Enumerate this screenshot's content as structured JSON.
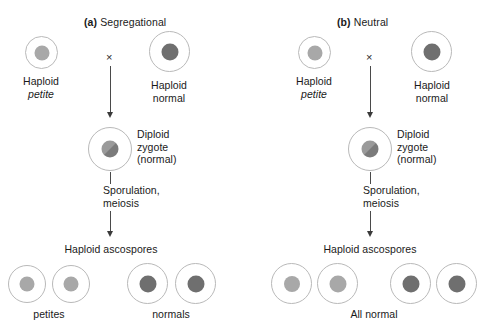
{
  "figure": {
    "caption_absent": true,
    "panels": [
      {
        "id": "a",
        "tag": "(a)",
        "title": "Segregational",
        "parents": [
          {
            "name": "haploid-petite",
            "label_line1": "Haploid",
            "label_line2": "petite",
            "label_line2_italic": true,
            "nucleus_shade": "light"
          },
          {
            "name": "haploid-normal",
            "label_line1": "Haploid",
            "label_line2": "normal",
            "label_line2_italic": false,
            "nucleus_shade": "dark"
          }
        ],
        "cross_symbol": "×",
        "zygote": {
          "label_line1": "Diploid",
          "label_line2": "zygote",
          "label_line3": "(normal)",
          "nucleus_shade": "mixed"
        },
        "process_line1": "Sporulation,",
        "process_line2": "meiosis",
        "ascospores_title": "Haploid ascospores",
        "ascospores": [
          {
            "nucleus_shade": "light"
          },
          {
            "nucleus_shade": "light"
          },
          {
            "nucleus_shade": "dark"
          },
          {
            "nucleus_shade": "dark"
          }
        ],
        "outcome_labels": [
          {
            "text": "petites",
            "italic": true
          },
          {
            "text": "normals",
            "italic": false
          }
        ]
      },
      {
        "id": "b",
        "tag": "(b)",
        "title": "Neutral",
        "parents": [
          {
            "name": "haploid-petite",
            "label_line1": "Haploid",
            "label_line2": "petite",
            "label_line2_italic": true,
            "nucleus_shade": "light"
          },
          {
            "name": "haploid-normal",
            "label_line1": "Haploid",
            "label_line2": "normal",
            "label_line2_italic": false,
            "nucleus_shade": "dark"
          }
        ],
        "cross_symbol": "×",
        "zygote": {
          "label_line1": "Diploid",
          "label_line2": "zygote",
          "label_line3": "(normal)",
          "nucleus_shade": "mixed"
        },
        "process_line1": "Sporulation,",
        "process_line2": "meiosis",
        "ascospores_title": "Haploid ascospores",
        "ascospores": [
          {
            "nucleus_shade": "light"
          },
          {
            "nucleus_shade": "light"
          },
          {
            "nucleus_shade": "dark"
          },
          {
            "nucleus_shade": "dark"
          }
        ],
        "outcome_labels": [
          {
            "text": "All normal",
            "italic": false
          }
        ]
      }
    ],
    "colors": {
      "cell_outline": "#b9b9b9",
      "nucleus_light": "#a8a8a8",
      "nucleus_dark": "#6f6f6f",
      "arrow": "#4a4a4a",
      "text": "#1a1a1a",
      "background": "#ffffff"
    }
  }
}
